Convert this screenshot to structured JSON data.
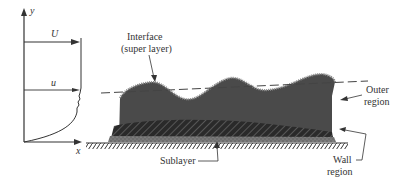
{
  "diagram": {
    "axes": {
      "y_label": "y",
      "x_label": "x"
    },
    "velocity_profile": {
      "freestream_label": "U",
      "local_label": "u"
    },
    "labels": {
      "interface_line1": "Interface",
      "interface_line2": "(super layer)",
      "outer_line1": "Outer",
      "outer_line2": "region",
      "sublayer": "Sublayer",
      "wall_line1": "Wall",
      "wall_line2": "region"
    },
    "colors": {
      "ink": "#333333",
      "outer_region": "#4a4a4a",
      "wall_region": "#2e2e2e",
      "sublayer": "#7a7a7a",
      "background": "#ffffff"
    }
  }
}
